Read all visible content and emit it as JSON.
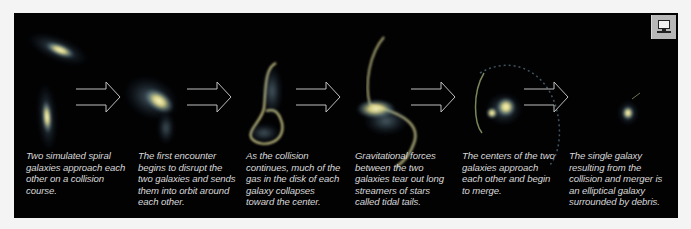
{
  "diagram": {
    "arrow_color": "#bfbfbf",
    "galaxy_core_color": "#f2eeaa",
    "galaxy_halo_color": "#6f8fa6",
    "stages": [
      {
        "id": "stage-1",
        "visual": "two-spiral-galaxies",
        "caption": "Two simulated spiral\ngalaxies approach each\nother on a collision\ncourse."
      },
      {
        "id": "stage-2",
        "visual": "first-encounter",
        "caption": "The first encounter\nbegins to disrupt the\ntwo galaxies and sends\nthem into orbit around\neach other."
      },
      {
        "id": "stage-3",
        "visual": "gas-collapse",
        "caption": "As the collision\ncontinues, much of the\ngas in the disk of each\ngalaxy collapses\ntoward the center."
      },
      {
        "id": "stage-4",
        "visual": "tidal-tails",
        "caption": "Gravitational forces\nbetween the two\ngalaxies tear out long\nstreamers of stars\ncalled  tidal tails."
      },
      {
        "id": "stage-5",
        "visual": "centers-merging",
        "caption": "The centers of the two\ngalaxies approach\neach other and begin\nto merge."
      },
      {
        "id": "stage-6",
        "visual": "elliptical-galaxy",
        "caption": "The single galaxy\nresulting from the\ncollision and merger is\nan elliptical galaxy\nsurrounded by debris."
      }
    ]
  },
  "toolbar": {
    "monitor_icon": "computer-monitor-icon"
  }
}
